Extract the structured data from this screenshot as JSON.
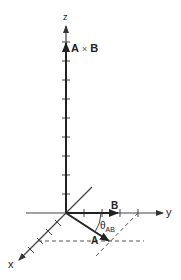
{
  "diagram": {
    "axes": {
      "x_label": "x",
      "y_label": "y",
      "z_label": "z"
    },
    "vectors": {
      "a_label": "A",
      "b_label": "B",
      "cross_label_a": "A",
      "cross_label_times": "×",
      "cross_label_b": "B"
    },
    "angle": {
      "symbol": "θ",
      "subscript": "AB"
    },
    "colors": {
      "axis": "#444444",
      "vector": "#222222",
      "dashed": "#555555",
      "background": "#ffffff"
    }
  }
}
